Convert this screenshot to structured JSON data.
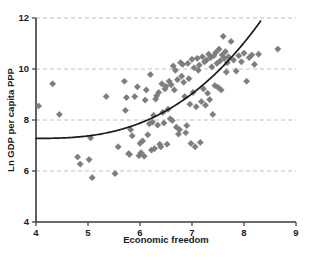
{
  "chart_data": {
    "type": "scatter",
    "title": "",
    "xlabel": "Economic freedom",
    "ylabel": "Ln GDP per capita PPP",
    "xlim": [
      4,
      9
    ],
    "ylim": [
      4,
      12
    ],
    "xticks": [
      "4",
      "5",
      "6",
      "7",
      "8",
      "9"
    ],
    "yticks": [
      "4",
      "6",
      "8",
      "10",
      "12"
    ],
    "xtick_values": [
      4,
      5,
      6,
      7,
      8,
      9
    ],
    "ytick_values": [
      4,
      6,
      8,
      10,
      12
    ],
    "grid": "horizontal-dashed",
    "gridline_values": [
      6,
      8,
      10,
      12
    ],
    "legend": "none",
    "marker_shape": "diamond",
    "marker_color": "#7d7d7d",
    "curve_color": "#1a1a1a",
    "curve_label": "fitted exponential trend",
    "series": [
      {
        "name": "Countries",
        "points": [
          [
            4.05,
            8.55
          ],
          [
            4.32,
            9.42
          ],
          [
            4.45,
            8.22
          ],
          [
            4.8,
            6.55
          ],
          [
            4.85,
            6.27
          ],
          [
            5.02,
            6.45
          ],
          [
            5.05,
            7.3
          ],
          [
            5.08,
            5.74
          ],
          [
            5.35,
            8.92
          ],
          [
            5.52,
            5.9
          ],
          [
            5.58,
            6.95
          ],
          [
            5.7,
            9.52
          ],
          [
            5.72,
            8.38
          ],
          [
            5.74,
            8.88
          ],
          [
            5.78,
            6.68
          ],
          [
            5.8,
            6.65
          ],
          [
            5.82,
            7.62
          ],
          [
            5.85,
            7.38
          ],
          [
            5.9,
            8.92
          ],
          [
            5.95,
            9.3
          ],
          [
            5.98,
            6.6
          ],
          [
            6.0,
            7.08
          ],
          [
            6.02,
            6.72
          ],
          [
            6.05,
            7.18
          ],
          [
            6.08,
            6.58
          ],
          [
            6.1,
            8.78
          ],
          [
            6.12,
            9.18
          ],
          [
            6.15,
            7.42
          ],
          [
            6.18,
            7.85
          ],
          [
            6.2,
            9.78
          ],
          [
            6.22,
            6.82
          ],
          [
            6.24,
            7.92
          ],
          [
            6.26,
            8.18
          ],
          [
            6.28,
            6.88
          ],
          [
            6.3,
            8.82
          ],
          [
            6.32,
            8.95
          ],
          [
            6.34,
            7.8
          ],
          [
            6.36,
            9.08
          ],
          [
            6.38,
            7.05
          ],
          [
            6.4,
            6.95
          ],
          [
            6.42,
            9.42
          ],
          [
            6.44,
            8.3
          ],
          [
            6.46,
            7.88
          ],
          [
            6.48,
            9.22
          ],
          [
            6.5,
            9.32
          ],
          [
            6.52,
            7.05
          ],
          [
            6.54,
            8.42
          ],
          [
            6.56,
            9.52
          ],
          [
            6.58,
            8.05
          ],
          [
            6.6,
            9.38
          ],
          [
            6.62,
            7.98
          ],
          [
            6.64,
            10.12
          ],
          [
            6.66,
            9.18
          ],
          [
            6.68,
            9.95
          ],
          [
            6.7,
            7.72
          ],
          [
            6.72,
            9.58
          ],
          [
            6.74,
            7.45
          ],
          [
            6.76,
            7.62
          ],
          [
            6.78,
            10.25
          ],
          [
            6.8,
            9.72
          ],
          [
            6.82,
            10.18
          ],
          [
            6.84,
            9.48
          ],
          [
            6.86,
            8.92
          ],
          [
            6.88,
            7.5
          ],
          [
            6.9,
            7.78
          ],
          [
            6.92,
            10.22
          ],
          [
            6.94,
            9.62
          ],
          [
            6.96,
            8.62
          ],
          [
            6.98,
            7.08
          ],
          [
            7.0,
            10.38
          ],
          [
            7.02,
            9.08
          ],
          [
            7.04,
            10.05
          ],
          [
            7.06,
            6.95
          ],
          [
            7.08,
            8.52
          ],
          [
            7.1,
            10.42
          ],
          [
            7.12,
            9.95
          ],
          [
            7.14,
            10.15
          ],
          [
            7.16,
            7.12
          ],
          [
            7.18,
            8.72
          ],
          [
            7.2,
            10.48
          ],
          [
            7.22,
            9.22
          ],
          [
            7.24,
            10.28
          ],
          [
            7.26,
            8.58
          ],
          [
            7.28,
            10.35
          ],
          [
            7.3,
            9.05
          ],
          [
            7.32,
            10.58
          ],
          [
            7.34,
            8.8
          ],
          [
            7.36,
            10.45
          ],
          [
            7.38,
            10.08
          ],
          [
            7.4,
            8.22
          ],
          [
            7.42,
            10.52
          ],
          [
            7.44,
            9.35
          ],
          [
            7.46,
            10.65
          ],
          [
            7.48,
            10.22
          ],
          [
            7.5,
            9.28
          ],
          [
            7.52,
            10.78
          ],
          [
            7.54,
            10.32
          ],
          [
            7.56,
            9.18
          ],
          [
            7.58,
            10.55
          ],
          [
            7.6,
            11.28
          ],
          [
            7.62,
            10.42
          ],
          [
            7.64,
            10.68
          ],
          [
            7.66,
            9.88
          ],
          [
            7.68,
            10.25
          ],
          [
            7.7,
            10.48
          ],
          [
            7.75,
            11.08
          ],
          [
            7.8,
            10.35
          ],
          [
            7.85,
            9.92
          ],
          [
            7.9,
            10.52
          ],
          [
            7.95,
            10.28
          ],
          [
            8.0,
            10.62
          ],
          [
            8.05,
            9.52
          ],
          [
            8.1,
            10.45
          ],
          [
            8.15,
            10.55
          ],
          [
            8.2,
            10.18
          ],
          [
            8.28,
            10.58
          ],
          [
            8.65,
            10.78
          ]
        ]
      }
    ],
    "trend_curve": {
      "x_start": 4.0,
      "x_end": 8.32,
      "y_start": 7.28,
      "y_end": 11.88,
      "description": "monotonically increasing convex curve"
    }
  }
}
